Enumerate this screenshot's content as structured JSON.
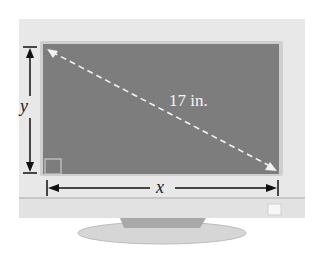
{
  "figure": {
    "diagonal_label": "17 in.",
    "height_label": "y",
    "width_label": "x"
  },
  "colors": {
    "bezel": "#e6e6e6",
    "screen": "#7d7d7d",
    "dimension_lines": "#111111",
    "diagonal": "#f2f2f2"
  }
}
